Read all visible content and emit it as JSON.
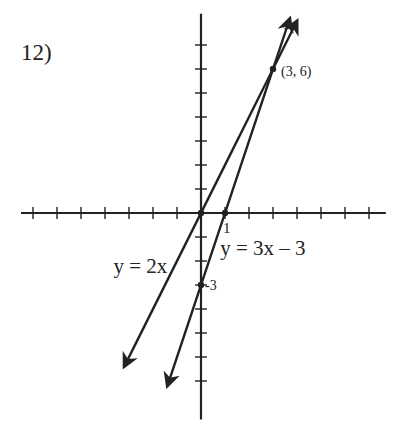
{
  "problem_label": "12)",
  "colors": {
    "ink": "#222222",
    "background": "#ffffff"
  },
  "chart_data": {
    "type": "line",
    "title": "",
    "xlabel": "",
    "ylabel": "",
    "grid": false,
    "axis_ranges": {
      "x": [
        -7.5,
        7.7
      ],
      "y": [
        -8.6,
        8.3
      ]
    },
    "tick_spacing": 1,
    "x_ticks": [
      -7,
      -6,
      -5,
      -4,
      -3,
      -2,
      -1,
      1,
      2,
      3,
      4,
      5,
      6,
      7
    ],
    "y_ticks": [
      -7,
      -6,
      -5,
      -4,
      -3,
      -2,
      -1,
      1,
      2,
      3,
      4,
      5,
      6,
      7
    ],
    "series": [
      {
        "name": "y = 2x",
        "equation": "y = 2x",
        "slope": 2,
        "intercept": 0,
        "x_range": [
          -3.2,
          4.0
        ]
      },
      {
        "name": "y = 3x - 3",
        "equation": "y = 3x – 3",
        "slope": 3,
        "intercept": -3,
        "x_range": [
          -1.4,
          3.7
        ]
      }
    ],
    "points": [
      {
        "x": 0,
        "y": 0,
        "label": ""
      },
      {
        "x": 1,
        "y": 0,
        "label": "1"
      },
      {
        "x": 0,
        "y": -3,
        "label": "-3"
      },
      {
        "x": 3,
        "y": 6,
        "label": "(3, 6)"
      }
    ],
    "annotations": [
      {
        "text": "y = 2x",
        "x": -3.65,
        "y": -2.5
      },
      {
        "text": "y = 3x – 3",
        "x": 0.8,
        "y": -1.75
      }
    ]
  },
  "layout": {
    "origin_px": [
      201,
      213
    ],
    "unit_px": 24
  }
}
